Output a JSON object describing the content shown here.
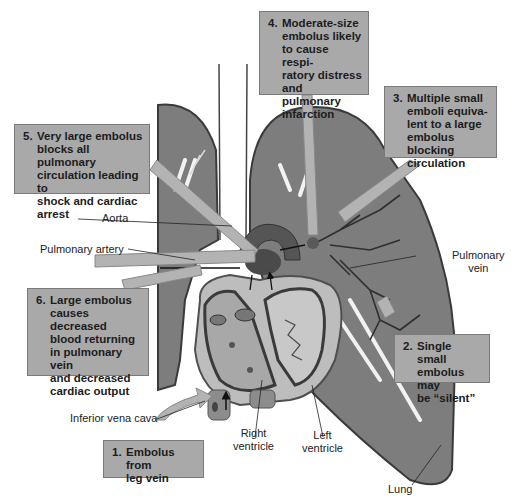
{
  "callouts": [
    {
      "num": "1.",
      "text": "Embolus from\nleg vein"
    },
    {
      "num": "2.",
      "text": "Single small\nembolus may\nbe “silent”"
    },
    {
      "num": "3.",
      "text": "Multiple small\nemboli equiva-\nlent to a large\nembolus blocking\ncirculation"
    },
    {
      "num": "4.",
      "text": "Moderate-size\nembolus likely\nto cause respi-\nratory distress\nand pulmonary\ninfarction"
    },
    {
      "num": "5.",
      "text": "Very large embolus\nblocks all pulmonary\ncirculation leading to\nshock and cardiac\narrest"
    },
    {
      "num": "6.",
      "text": "Large embolus\ncauses decreased\nblood returning\nin pulmonary vein\nand decreased\ncardiac output"
    }
  ],
  "labels": {
    "aorta": "Aorta",
    "pulmonary_artery": "Pulmonary artery",
    "pulmonary_vein": "Pulmonary\nvein",
    "inferior_vena_cava": "Inferior vena cava",
    "right_ventricle": "Right\nventricle",
    "left_ventricle": "Left\nventricle",
    "lung": "Lung"
  },
  "colors": {
    "lung": "#7d7d7d",
    "lung_outline": "#3a3a3a",
    "heart": "#b5b5b5",
    "heart_dark": "#5a5a5a",
    "callout_bg": "#a9a9a9",
    "arrow": "#b3b3b3"
  }
}
